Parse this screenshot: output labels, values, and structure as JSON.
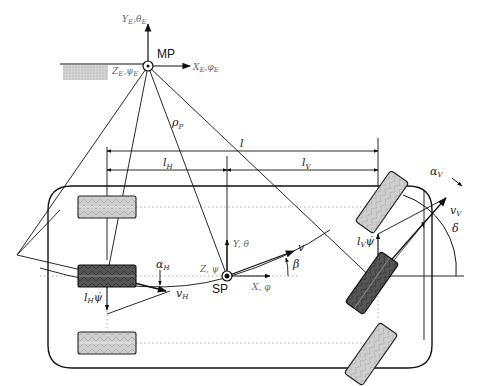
{
  "diagram": {
    "colors": {
      "line": "#111111",
      "dotted": "#9a9a9a",
      "tire_light": "#c9c9c9",
      "tire_dark": "#4a4a4a",
      "ground_hatch": "#bdbdbd",
      "grey_text": "#6b6b6b"
    },
    "points": {
      "mp": {
        "label": "MP",
        "x": 148,
        "y": 66
      },
      "sp": {
        "label": "SP",
        "x": 227,
        "y": 276
      }
    },
    "earth_axes": {
      "y_label": "Y",
      "y_sub": "E",
      "y_angle": "θ",
      "y_angle_sub": "E",
      "x_label": "X",
      "x_sub": "E",
      "x_angle": "φ",
      "x_angle_sub": "E",
      "z_label": "Z",
      "z_sub": "E",
      "z_angle": "ψ",
      "z_angle_sub": "E"
    },
    "vehicle_axes": {
      "y_label": "Y, θ",
      "x_label": "X, φ",
      "z_label": "Z, ψ"
    },
    "dimensions": {
      "wheelbase": "l",
      "rear_dist": "l",
      "rear_sub": "H",
      "front_dist": "l",
      "front_sub": "V",
      "radius": "ρ",
      "radius_sub": "P"
    },
    "velocities": {
      "v": "v",
      "v_rear": "v",
      "v_rear_sub": "H",
      "v_front": "v",
      "v_front_sub": "V",
      "rear_yaw_term": "l",
      "rear_yaw_sub": "H",
      "rear_yaw_dot": "ψ̇",
      "front_yaw_term": "l",
      "front_yaw_sub": "V",
      "front_yaw_dot": "ψ̇"
    },
    "angles": {
      "beta": "β",
      "alpha_rear": "α",
      "alpha_rear_sub": "H",
      "alpha_front": "α",
      "alpha_front_sub": "V",
      "delta": "δ"
    },
    "wheels": [
      {
        "id": "rear-left",
        "x": 78,
        "y": 196,
        "w": 58,
        "h": 22,
        "angle": 0,
        "shade": "light"
      },
      {
        "id": "rear-center",
        "x": 78,
        "y": 265,
        "w": 58,
        "h": 22,
        "angle": 0,
        "shade": "dark"
      },
      {
        "id": "rear-right",
        "x": 78,
        "y": 332,
        "w": 58,
        "h": 22,
        "angle": 0,
        "shade": "light"
      },
      {
        "id": "front-left",
        "cx": 382,
        "cy": 200,
        "w": 62,
        "h": 22,
        "angle": -55,
        "shade": "light"
      },
      {
        "id": "front-center",
        "cx": 370,
        "cy": 283,
        "w": 62,
        "h": 22,
        "angle": -55,
        "shade": "dark"
      },
      {
        "id": "front-right",
        "cx": 371,
        "cy": 350,
        "w": 62,
        "h": 22,
        "angle": -55,
        "shade": "light"
      }
    ]
  }
}
